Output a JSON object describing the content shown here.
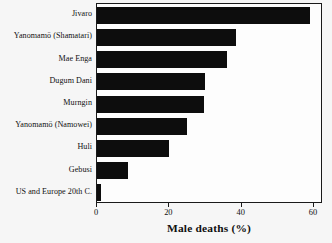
{
  "chart_data": {
    "type": "bar",
    "orientation": "horizontal",
    "title": "",
    "xlabel": "Male deaths (%)",
    "ylabel": "",
    "categories": [
      "Jivaro",
      "Yanomamö (Shamatari)",
      "Mae Enga",
      "Dugum Dani",
      "Murngin",
      "Yanomamö (Namowei)",
      "Huli",
      "Gebusi",
      "US and Europe 20th C."
    ],
    "values": [
      59,
      38.5,
      36,
      30,
      29.5,
      25,
      20,
      8.5,
      1
    ],
    "xlim": [
      0,
      62.5
    ],
    "xticks": [
      0,
      20,
      40,
      60
    ],
    "xtick_labels": [
      "0",
      "20",
      "40",
      "60"
    ],
    "grid": false,
    "legend": false,
    "bar_color": "#0d0d0d",
    "plot_background": "#fdfdfd",
    "figure_background": "#f6f6f6",
    "axis_color": "#1a1a1a"
  }
}
